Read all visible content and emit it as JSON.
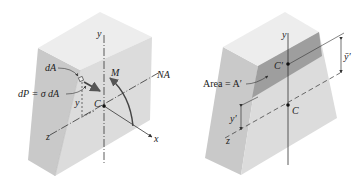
{
  "figures": [
    {
      "id": "left",
      "labels": {
        "dA": "dA",
        "dP": "dP = σ dA",
        "y_axis": "y",
        "z_axis": "z",
        "x_axis": "x",
        "moment": "M",
        "neutral_axis": "NA",
        "centroid": "C",
        "distance_y": "y"
      }
    },
    {
      "id": "right",
      "labels": {
        "y_axis": "y",
        "z_axis": "z",
        "area": "Area = A′",
        "centroid_prime": "C′",
        "centroid": "C",
        "y_bar_prime": "ȳ′",
        "y_prime": "y′"
      }
    }
  ],
  "colors": {
    "top_face": "#ececec",
    "left_face": "#c9c9c9",
    "front_face": "#dedede",
    "shaded_band": "#9d9d9d",
    "lines": "#333333"
  }
}
